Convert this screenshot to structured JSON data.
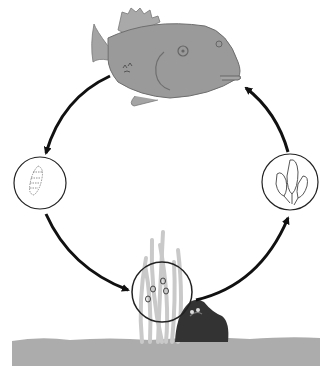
{
  "diagram": {
    "type": "life-cycle",
    "stages": [
      {
        "id": "adult",
        "name": "adult fish",
        "position": "top"
      },
      {
        "id": "larva",
        "name": "larva",
        "position": "left"
      },
      {
        "id": "eggs",
        "name": "eggs on seagrass near rock",
        "position": "bottom"
      },
      {
        "id": "juveniles",
        "name": "young fry",
        "position": "right"
      }
    ],
    "arrows": [
      {
        "from": "adult",
        "to": "larva"
      },
      {
        "from": "larva",
        "to": "eggs"
      },
      {
        "from": "eggs",
        "to": "juveniles"
      },
      {
        "from": "juveniles",
        "to": "adult"
      }
    ],
    "colors": {
      "fish": "#9a9a9a",
      "fish_outline": "#6e6e6e",
      "arrow": "#111111",
      "circle": "#222222",
      "ground": "#a9a9a9",
      "seagrass": "#c8c8c8",
      "rock": "#2e2e2e"
    }
  }
}
